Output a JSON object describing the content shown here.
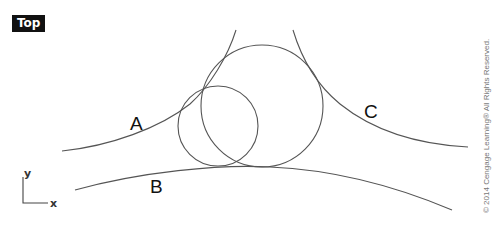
{
  "viewport": {
    "label": "Top"
  },
  "curves": [
    {
      "id": "A",
      "label": "A",
      "label_pos": [
        130,
        130
      ]
    },
    {
      "id": "B",
      "label": "B",
      "label_pos": [
        150,
        193
      ]
    },
    {
      "id": "C",
      "label": "C",
      "label_pos": [
        364,
        118
      ]
    }
  ],
  "circles": [
    {
      "id": "small",
      "cx": 218,
      "cy": 126,
      "r": 40
    },
    {
      "id": "large",
      "cx": 262,
      "cy": 106,
      "r": 61
    }
  ],
  "axes": {
    "x_label": "x",
    "y_label": "y"
  },
  "copyright": "© 2014 Cengage Learning® All Rights Reserved."
}
